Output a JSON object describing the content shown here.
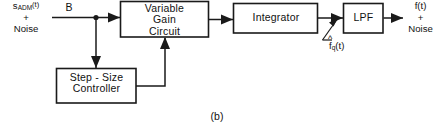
{
  "figure": {
    "caption": "(b)",
    "background_color": "#ffffff",
    "line_color": "#1a1a1a",
    "text_color": "#111111"
  },
  "blocks": [
    {
      "id": "variable-gain-circuit",
      "lines": [
        "Variable",
        "Gain",
        "Circuit"
      ],
      "text": "Variable\nGain\nCircuit"
    },
    {
      "id": "integrator",
      "lines": [
        "Integrator"
      ],
      "text": "Integrator"
    },
    {
      "id": "lpf",
      "lines": [
        "LPF"
      ],
      "text": "LPF"
    },
    {
      "id": "step-size-controller",
      "lines": [
        "Step - Size",
        "Controller"
      ],
      "text": "Step - Size\nController"
    }
  ],
  "labels": {
    "input_signal_main": "s",
    "input_signal_sub": "ADM",
    "input_signal_arg": "(t)",
    "input_plus": "+",
    "input_noise": "Noise",
    "branch_label": "B",
    "feedback_label_base": "f",
    "feedback_label_hat": "^",
    "feedback_label_sub": "q",
    "feedback_label_arg": "(t)",
    "output_signal": "f(t)",
    "output_plus": "+",
    "output_noise": "Noise"
  },
  "icons": {
    "arrow_right": "arrow-right-icon",
    "arrow_down": "arrow-down-icon",
    "arrow_up": "arrow-up-icon",
    "junction": "junction-dot-icon",
    "pointer": "pointer-leader-icon"
  }
}
